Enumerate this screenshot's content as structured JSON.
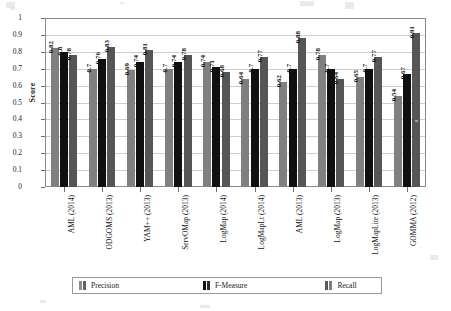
{
  "chart_data": {
    "type": "bar",
    "title": "",
    "xlabel": "",
    "ylabel": "Score",
    "ylim": [
      0,
      1
    ],
    "ytick_labels": [
      "1",
      "0.9",
      "0.8",
      "0.7",
      "0.6",
      "0.5",
      "0.4",
      "0.3",
      "0.2",
      "0.1",
      "0"
    ],
    "ytick_values": [
      1,
      0.9,
      0.8,
      0.7,
      0.6,
      0.5,
      0.4,
      0.3,
      0.2,
      0.1,
      0
    ],
    "grid": true,
    "legend_position": "bottom",
    "categories": [
      "AML (2014)",
      "ODGOMS (2013)",
      "YAM++ (2013)",
      "ServOMap (2013)",
      "LogMap (2014)",
      "LogMapLt (2014)",
      "AML (2013)",
      "LogMap (2013)",
      "LogMapLite (2013)",
      "GOMMA (2012)"
    ],
    "series": [
      {
        "name": "Precision",
        "color": "#808080",
        "values": [
          0.82,
          0.7,
          0.69,
          0.7,
          0.74,
          0.64,
          0.62,
          0.78,
          0.65,
          0.54
        ],
        "labels": [
          "0.82",
          "0.7",
          "0.69",
          "0.7",
          "0.74",
          "0.64",
          "0.62",
          "0.78",
          "0.65",
          "0.54"
        ]
      },
      {
        "name": "F-Measure",
        "color": "#101010",
        "values": [
          0.8,
          0.76,
          0.74,
          0.74,
          0.71,
          0.7,
          0.7,
          0.7,
          0.7,
          0.67
        ],
        "labels": [
          "0.8",
          "0.76",
          "0.74",
          "0.74",
          "0.71",
          "0.7",
          "0.7",
          "0.7",
          "0.7",
          "0.67"
        ]
      },
      {
        "name": "Recall",
        "color": "#565656",
        "values": [
          0.78,
          0.83,
          0.81,
          0.78,
          0.68,
          0.77,
          0.88,
          0.64,
          0.77,
          0.91
        ],
        "labels": [
          "0.78",
          "0.83",
          "0.81",
          "0.78",
          "0.68",
          "0.77",
          "0.88",
          "0.64",
          "0.77",
          "0.91"
        ]
      }
    ]
  },
  "legend": {
    "items": [
      {
        "label": "Precision"
      },
      {
        "label": "F-Measure"
      },
      {
        "label": "Recall"
      }
    ]
  }
}
